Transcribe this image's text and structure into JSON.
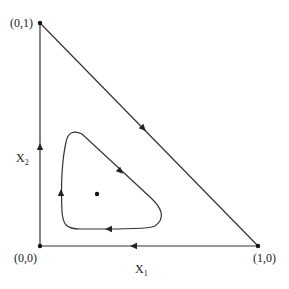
{
  "diagram": {
    "type": "phase-portrait-simplex",
    "vertices": {
      "top": {
        "label": "(0,1)",
        "x": 40,
        "y": 23
      },
      "origin": {
        "label": "(0,0)",
        "x": 40,
        "y": 246
      },
      "right": {
        "label": "(1,0)",
        "x": 258,
        "y": 246
      }
    },
    "axes": {
      "x_label": "X",
      "x_sub": "1",
      "y_label": "X",
      "y_sub": "2"
    },
    "edge_arrows": [
      {
        "edge": "hypotenuse",
        "direction": "down-right"
      },
      {
        "edge": "bottom",
        "direction": "left"
      },
      {
        "edge": "left",
        "direction": "up"
      }
    ],
    "closed_orbit": {
      "direction": "counterclockwise",
      "arrows": [
        "down-right",
        "left",
        "up"
      ]
    },
    "interior_fixed_point": {
      "x": 97,
      "y": 194
    },
    "colors": {
      "line": "#333333",
      "point": "#111111"
    }
  }
}
